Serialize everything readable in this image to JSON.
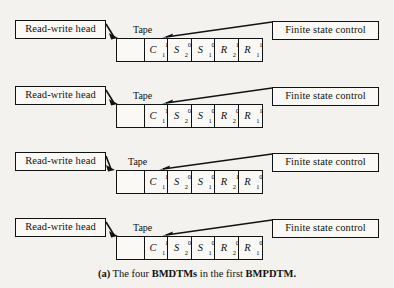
{
  "figure": {
    "caption": {
      "label": "(a)",
      "text_1": "The four",
      "bold_1": "BMDTMs",
      "text_2": "in the first",
      "bold_2": "BMPDTM."
    },
    "colors": {
      "page_background": "#f3f2ee",
      "box_fill": "#faf9f6",
      "ink": "#121212"
    },
    "rows": [
      {
        "name": "bmdtm-1",
        "head_label": "Read-write head",
        "tape_label": "Tape",
        "control_label": "Finite state control",
        "cells": [
          {
            "base": "",
            "sub": "",
            "sup": "",
            "blank": true
          },
          {
            "base": "C",
            "sub": "1",
            "sup": "1",
            "blank": false
          },
          {
            "base": "S",
            "sub": "2",
            "sup": "0",
            "blank": false
          },
          {
            "base": "S",
            "sub": "1",
            "sup": "0",
            "blank": false
          },
          {
            "base": "R",
            "sub": "2",
            "sup": "1",
            "blank": false
          },
          {
            "base": "R",
            "sub": "1",
            "sup": "1",
            "blank": false
          }
        ]
      },
      {
        "name": "bmdtm-2",
        "head_label": "Read-write head",
        "tape_label": "Tape",
        "control_label": "Finite state control",
        "cells": [
          {
            "base": "",
            "sub": "",
            "sup": "",
            "blank": true
          },
          {
            "base": "C",
            "sub": "1",
            "sup": "1",
            "blank": false
          },
          {
            "base": "S",
            "sub": "2",
            "sup": "0",
            "blank": false
          },
          {
            "base": "S",
            "sub": "1",
            "sup": "0",
            "blank": false
          },
          {
            "base": "R",
            "sub": "2",
            "sup": "0",
            "blank": false
          },
          {
            "base": "R",
            "sub": "1",
            "sup": "1",
            "blank": false
          }
        ]
      },
      {
        "name": "bmdtm-3",
        "head_label": "Read-write head",
        "tape_label": "Tape",
        "control_label": "Finite state control",
        "cells": [
          {
            "base": "",
            "sub": "",
            "sup": "",
            "blank": true
          },
          {
            "base": "C",
            "sub": "1",
            "sup": "1",
            "blank": false
          },
          {
            "base": "S",
            "sub": "2",
            "sup": "0",
            "blank": false
          },
          {
            "base": "S",
            "sub": "1",
            "sup": "0",
            "blank": false
          },
          {
            "base": "R",
            "sub": "2",
            "sup": "1",
            "blank": false
          },
          {
            "base": "R",
            "sub": "1",
            "sup": "0",
            "blank": false
          }
        ]
      },
      {
        "name": "bmdtm-4",
        "head_label": "Read-write head",
        "tape_label": "Tape",
        "control_label": "Finite state control",
        "cells": [
          {
            "base": "",
            "sub": "",
            "sup": "",
            "blank": true
          },
          {
            "base": "C",
            "sub": "1",
            "sup": "1",
            "blank": false
          },
          {
            "base": "S",
            "sub": "2",
            "sup": "0",
            "blank": false
          },
          {
            "base": "S",
            "sub": "1",
            "sup": "0",
            "blank": false
          },
          {
            "base": "R",
            "sub": "2",
            "sup": "0",
            "blank": false
          },
          {
            "base": "R",
            "sub": "1",
            "sup": "0",
            "blank": false
          }
        ]
      }
    ]
  }
}
